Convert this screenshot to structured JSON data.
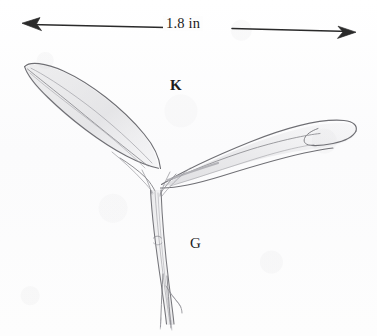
{
  "figure": {
    "type": "botanical-pencil-illustration",
    "background_color": "#fdfdfd",
    "ink_color": "#6a6a6a",
    "text_color": "#1a1a1a"
  },
  "scale_bar": {
    "measurement_label": "1.8 in",
    "left_arrow_icon": "arrow-left-icon",
    "right_arrow_icon": "arrow-right-icon",
    "x_start": 22,
    "x_end": 356,
    "y_start": 23,
    "y_end": 32
  },
  "annotations": [
    {
      "id": "K",
      "label": "K",
      "x": 176,
      "y": 86,
      "description": "upper label between the two leaves"
    },
    {
      "id": "G",
      "label": "G",
      "x": 196,
      "y": 244,
      "description": "lower label right of the stem"
    }
  ],
  "plant": {
    "left_leaf": {
      "name": "left-leaf",
      "tip_x": 24,
      "tip_y": 66,
      "base_x": 152,
      "base_y": 192,
      "shape": "lanceolate, pointed tip, curving up-left"
    },
    "right_leaf": {
      "name": "right-leaf",
      "tip_x": 356,
      "tip_y": 118,
      "base_x": 160,
      "base_y": 190,
      "shape": "broad, blunt hooked tip, curving up-right"
    },
    "stem": {
      "name": "stem",
      "top_x": 156,
      "top_y": 190,
      "bottom_x": 170,
      "bottom_y": 326
    },
    "roots": {
      "name": "root-strands",
      "count": 3,
      "bottom_y": 326
    }
  }
}
